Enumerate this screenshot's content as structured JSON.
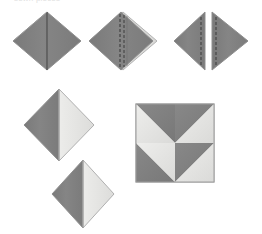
{
  "page": {
    "background_color": "#ffffff",
    "width": 262,
    "height": 234,
    "caption_text": "sewn pieces"
  },
  "palette": {
    "fabric_dark": "#808080",
    "fabric_dark_shade": "#6f6f6f",
    "fabric_light": "#e4e4e2",
    "fabric_light_shade": "#d6d6d4",
    "outline": "#8e8e8e",
    "seam_line": "#4a4a4a",
    "stitch_dash": "#3c3c3c",
    "background": "#ffffff"
  },
  "figures": [
    {
      "id": "figure-1",
      "name": "folded-diamond-center-seam",
      "type": "diamond",
      "label": "Folded square with center seam",
      "fill": "#808080",
      "center_line": "solid",
      "center_line_color": "#4a4a4a",
      "x": 13,
      "y": 12,
      "width": 68,
      "height": 58
    },
    {
      "id": "figure-2",
      "name": "diamond-with-stitching",
      "type": "diamond",
      "label": "Diamond with double stitching line",
      "fill": "#808080",
      "center_line": "dashed",
      "center_line_color": "#3c3c3c",
      "highlight_edge": "right",
      "x": 89,
      "y": 12,
      "width": 68,
      "height": 58
    },
    {
      "id": "figure-3",
      "name": "split-diamond-halves",
      "type": "split-diamond",
      "label": "Diamond cut into two mirrored halves",
      "fill": "#808080",
      "center_line": "dashed",
      "center_line_color": "#3c3c3c",
      "gap": 6,
      "x": 174,
      "y": 12,
      "width": 74,
      "height": 58
    },
    {
      "id": "figure-4",
      "name": "two-tone-diamond-large",
      "type": "two-tone-diamond",
      "label": "Diamond pieced from dark and light halves",
      "fill_left": "#808080",
      "fill_right": "#e4e4e2",
      "x": 24,
      "y": 89,
      "width": 70,
      "height": 72
    },
    {
      "id": "figure-5",
      "name": "two-tone-diamond-small",
      "type": "two-tone-diamond",
      "label": "Smaller pieced diamond unit",
      "fill_left": "#808080",
      "fill_right": "#e4e4e2",
      "x": 52,
      "y": 160,
      "width": 62,
      "height": 68
    },
    {
      "id": "figure-6",
      "name": "pinwheel-block",
      "type": "pinwheel",
      "label": "Finished pinwheel block of four half-square triangles",
      "fill_dark": "#808080",
      "fill_light": "#e4e4e2",
      "x": 136,
      "y": 104,
      "size": 78,
      "quadrants": [
        {
          "name": "top-left",
          "dark_corner": "top-right"
        },
        {
          "name": "top-right",
          "dark_corner": "top-left"
        },
        {
          "name": "bottom-left",
          "dark_corner": "bottom-left"
        },
        {
          "name": "bottom-right",
          "dark_corner": "top-left"
        }
      ]
    }
  ]
}
